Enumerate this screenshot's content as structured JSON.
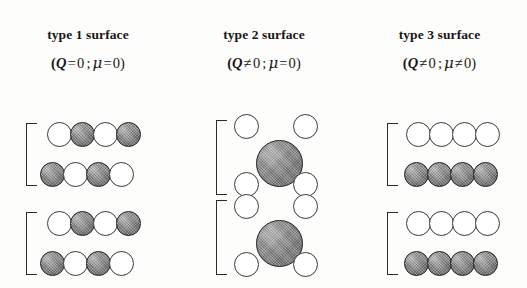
{
  "figure": {
    "background_color": "#fdfdfc",
    "open_atom_color": "#ffffff",
    "filled_atom_color": "#8a8a8a",
    "outline_color": "#2b2b2b"
  },
  "columns": [
    {
      "id": "type-1",
      "title": "type 1 surface",
      "formula": {
        "open_paren": "(",
        "charge_symbol": "Q",
        "charge_relation": "=",
        "charge_value": "0",
        "separator": ";",
        "dipole_symbol": "μ",
        "dipole_relation": "=",
        "dipole_value": "0",
        "close_paren": ")"
      },
      "structure": {
        "description": "alternating mixed-ion planes",
        "units": [
          {
            "rows": [
              {
                "atoms": [
                  "open",
                  "filled",
                  "open",
                  "filled"
                ]
              },
              {
                "atoms": [
                  "filled",
                  "open",
                  "filled",
                  "open"
                ]
              }
            ]
          },
          {
            "rows": [
              {
                "atoms": [
                  "open",
                  "filled",
                  "open",
                  "filled"
                ]
              },
              {
                "atoms": [
                  "filled",
                  "open",
                  "filled",
                  "open"
                ]
              }
            ]
          }
        ]
      }
    },
    {
      "id": "type-2",
      "title": "type 2 surface",
      "formula": {
        "open_paren": "(",
        "charge_symbol": "Q",
        "charge_relation": "≠",
        "charge_value": "0",
        "separator": ";",
        "dipole_symbol": "μ",
        "dipole_relation": "=",
        "dipole_value": "0",
        "close_paren": ")"
      },
      "structure": {
        "description": "charged planes stacked symmetrically, zero net dipole",
        "units": [
          {
            "rows": [
              {
                "atoms": [
                  "open",
                  "open"
                ]
              },
              {
                "atoms": [
                  "filled-large"
                ]
              },
              {
                "atoms": [
                  "open",
                  "open"
                ]
              }
            ]
          },
          {
            "rows": [
              {
                "atoms": [
                  "open",
                  "open"
                ]
              },
              {
                "atoms": [
                  "filled-large"
                ]
              },
              {
                "atoms": [
                  "open",
                  "open"
                ]
              }
            ]
          }
        ]
      }
    },
    {
      "id": "type-3",
      "title": "type 3 surface",
      "formula": {
        "open_paren": "(",
        "charge_symbol": "Q",
        "charge_relation": "≠",
        "charge_value": "0",
        "separator": ";",
        "dipole_symbol": "μ",
        "dipole_relation": "≠",
        "dipole_value": "0",
        "close_paren": ")"
      },
      "structure": {
        "description": "alternating charged planes giving a net dipole",
        "units": [
          {
            "rows": [
              {
                "atoms": [
                  "open",
                  "open",
                  "open",
                  "open"
                ]
              },
              {
                "atoms": [
                  "filled",
                  "filled",
                  "filled",
                  "filled"
                ]
              }
            ]
          },
          {
            "rows": [
              {
                "atoms": [
                  "open",
                  "open",
                  "open",
                  "open"
                ]
              },
              {
                "atoms": [
                  "filled",
                  "filled",
                  "filled",
                  "filled"
                ]
              }
            ]
          }
        ]
      }
    }
  ]
}
